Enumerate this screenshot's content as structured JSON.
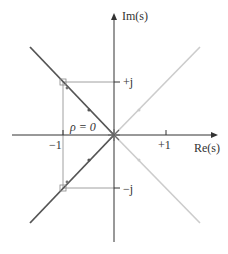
{
  "axes": {
    "x_label": "Re(s)",
    "y_label": "Im(s)",
    "x_ticks": [
      "−1",
      "+1"
    ],
    "y_ticks": [
      "+j",
      "−j"
    ]
  },
  "annotation": "ρ = 0",
  "colors": {
    "axis": "#333333",
    "locus_dark": "#555555",
    "locus_light": "#cccccc",
    "guide": "#888888"
  },
  "loci": [
    {
      "name": "upper-left",
      "shade": "dark"
    },
    {
      "name": "lower-left",
      "shade": "dark"
    },
    {
      "name": "upper-right",
      "shade": "light"
    },
    {
      "name": "lower-right",
      "shade": "light"
    }
  ]
}
